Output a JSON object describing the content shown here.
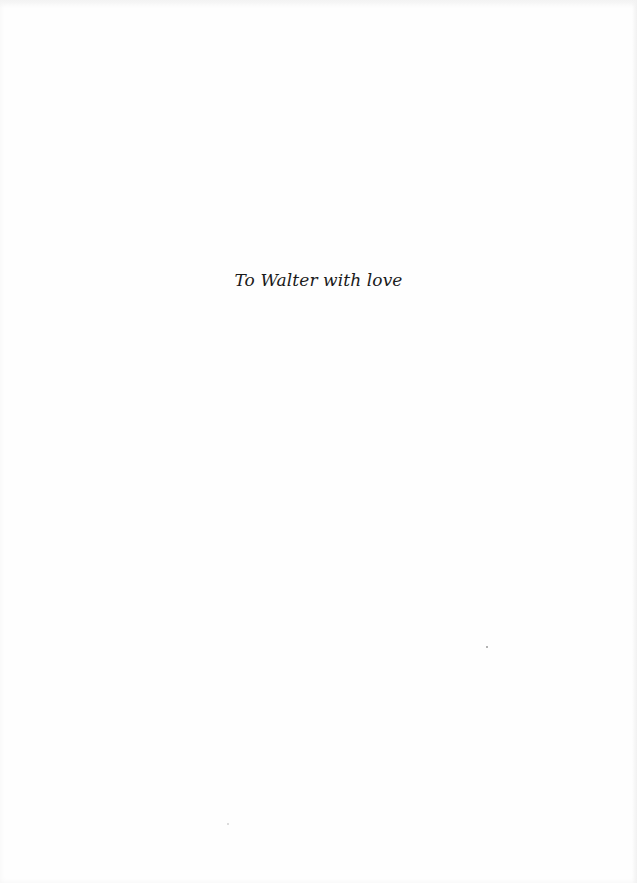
{
  "page": {
    "type": "dedication",
    "background_color": "#fefefe",
    "text_color": "#1a1a1a"
  },
  "dedication": {
    "text": "To Walter with love"
  }
}
